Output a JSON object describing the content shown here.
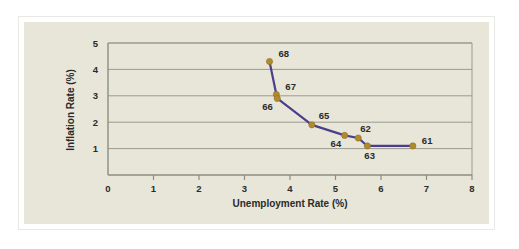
{
  "chart_data": {
    "type": "line",
    "title": "",
    "subtitle": "",
    "xlabel": "Unemployment Rate (%)",
    "ylabel": "Inflation Rate (%)",
    "xlim": [
      0,
      8
    ],
    "ylim": [
      0,
      5
    ],
    "xticks": [
      "0",
      "1",
      "2",
      "3",
      "4",
      "5",
      "6",
      "7",
      "8"
    ],
    "yticks": [
      "1",
      "2",
      "3",
      "4",
      "5"
    ],
    "grid": "horizontal",
    "legend": "none",
    "marker_color": "#b08a2e",
    "line_color": "#4b3f8c",
    "background_color": "#e7e6d8",
    "series": [
      {
        "name": "Phillips Curve",
        "points": [
          {
            "label": "68",
            "x": 3.55,
            "y": 4.3,
            "label_dx": 9,
            "label_dy": -4
          },
          {
            "label": "67",
            "x": 3.7,
            "y": 3.05,
            "label_dx": 9,
            "label_dy": -4
          },
          {
            "label": "66",
            "x": 3.72,
            "y": 2.9,
            "label_dx": -15,
            "label_dy": 12
          },
          {
            "label": "65",
            "x": 4.48,
            "y": 1.9,
            "label_dx": 7,
            "label_dy": -6
          },
          {
            "label": "64",
            "x": 5.2,
            "y": 1.5,
            "label_dx": -14,
            "label_dy": 12
          },
          {
            "label": "62",
            "x": 5.5,
            "y": 1.4,
            "label_dx": 2,
            "label_dy": -6
          },
          {
            "label": "63",
            "x": 5.7,
            "y": 1.1,
            "label_dx": -3,
            "label_dy": 13
          },
          {
            "label": "61",
            "x": 6.7,
            "y": 1.1,
            "label_dx": 9,
            "label_dy": -2
          }
        ]
      }
    ]
  }
}
